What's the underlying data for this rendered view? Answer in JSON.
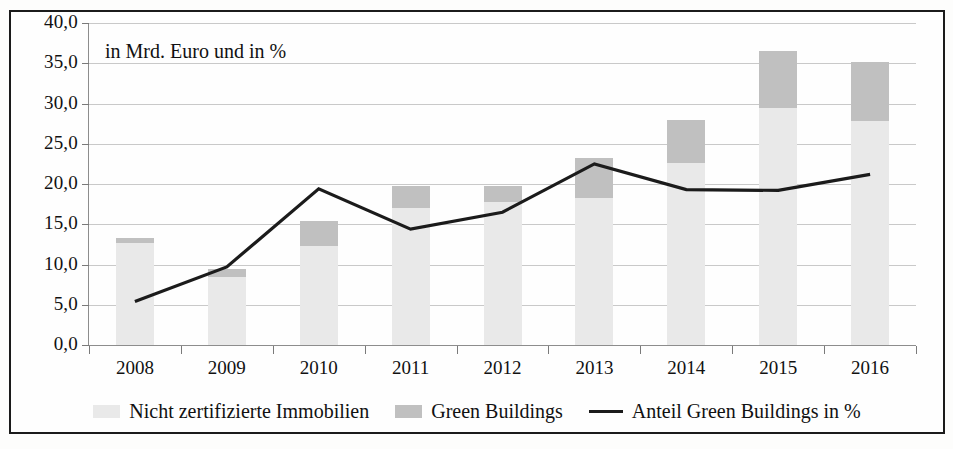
{
  "annotation": "in Mrd. Euro und in %",
  "axis": {
    "y_ticks": [
      "0,0",
      "5,0",
      "10,0",
      "15,0",
      "20,0",
      "25,0",
      "30,0",
      "35,0",
      "40,0"
    ],
    "x_ticks": [
      "2008",
      "2009",
      "2010",
      "2011",
      "2012",
      "2013",
      "2014",
      "2015",
      "2016"
    ]
  },
  "legend": {
    "items": [
      {
        "label": "Nicht zertifizierte Immobilien",
        "type": "swatch",
        "color": "#e9e9e9"
      },
      {
        "label": "Green Buildings",
        "type": "swatch",
        "color": "#c0c0c0"
      },
      {
        "label": "Anteil Green Buildings in %",
        "type": "line",
        "color": "#1b1b1b"
      }
    ]
  },
  "colors": {
    "non_certified": "#e9e9e9",
    "green_buildings": "#c0c0c0",
    "line": "#1b1b1b",
    "grid": "#c9c9c9",
    "frame": "#1b1b1b",
    "text": "#111111"
  },
  "chart_data": {
    "type": "bar",
    "title": "",
    "subtitle": "in Mrd. Euro und in %",
    "xlabel": "",
    "ylabel": "",
    "ylim": [
      0,
      40
    ],
    "ytick_step": 5,
    "grid": true,
    "legend_position": "bottom",
    "stacked": true,
    "categories": [
      "2008",
      "2009",
      "2010",
      "2011",
      "2012",
      "2013",
      "2014",
      "2015",
      "2016"
    ],
    "series": [
      {
        "name": "Nicht zertifizierte Immobilien",
        "type": "bar",
        "values": [
          12.7,
          8.5,
          12.3,
          17.0,
          17.8,
          18.2,
          22.6,
          29.4,
          27.8
        ]
      },
      {
        "name": "Green Buildings",
        "type": "bar",
        "values": [
          0.6,
          0.9,
          3.1,
          2.8,
          2.0,
          5.0,
          5.4,
          7.1,
          7.4
        ]
      },
      {
        "name": "Anteil Green Buildings in %",
        "type": "line",
        "values": [
          5.4,
          9.7,
          19.4,
          14.4,
          16.5,
          22.5,
          19.3,
          19.2,
          21.2
        ]
      }
    ],
    "totals": [
      13.3,
      9.4,
      15.4,
      19.8,
      19.8,
      23.2,
      28.0,
      36.5,
      35.2
    ]
  }
}
